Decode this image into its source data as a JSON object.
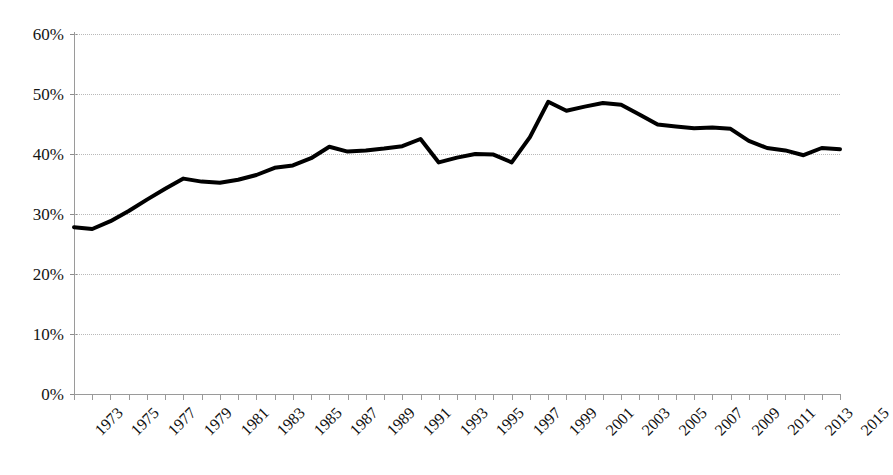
{
  "chart_data": {
    "type": "line",
    "title": "",
    "subtitle": "",
    "xlabel": "",
    "ylabel": "",
    "ylim": [
      0,
      60
    ],
    "xlim": [
      1973,
      2015
    ],
    "grid": true,
    "legend_position": "none",
    "y_tick_labels": [
      "60%",
      "50%",
      "40%",
      "30%",
      "20%",
      "10%",
      "0%"
    ],
    "y_tick_values": [
      60,
      50,
      40,
      30,
      20,
      10,
      0
    ],
    "x_tick_labels": [
      "1973",
      "1975",
      "1977",
      "1979",
      "1981",
      "1983",
      "1985",
      "1987",
      "1989",
      "1991",
      "1993",
      "1995",
      "1997",
      "1999",
      "2001",
      "2003",
      "2005",
      "2007",
      "2009",
      "2011",
      "2013",
      "2015"
    ],
    "x": [
      1973,
      1974,
      1975,
      1976,
      1977,
      1978,
      1979,
      1980,
      1981,
      1982,
      1983,
      1984,
      1985,
      1986,
      1987,
      1988,
      1989,
      1990,
      1991,
      1992,
      1993,
      1994,
      1995,
      1996,
      1997,
      1998,
      1999,
      2000,
      2001,
      2002,
      2003,
      2004,
      2005,
      2006,
      2007,
      2008,
      2009,
      2010,
      2011,
      2012,
      2013,
      2014,
      2015
    ],
    "series": [
      {
        "name": "Share",
        "color": "#000000",
        "values": [
          27.8,
          27.5,
          28.8,
          30.5,
          32.4,
          34.2,
          35.9,
          35.4,
          35.2,
          35.7,
          36.5,
          37.7,
          38.1,
          39.3,
          41.2,
          40.4,
          40.6,
          40.9,
          41.3,
          42.5,
          38.6,
          39.4,
          40.0,
          39.9,
          38.6,
          42.8,
          48.7,
          47.2,
          47.9,
          48.5,
          48.2,
          46.6,
          44.9,
          44.6,
          44.3,
          44.4,
          44.2,
          42.2,
          41.0,
          40.6,
          39.8,
          41.0,
          40.8
        ]
      }
    ],
    "units": "percent",
    "line_width_px": 4
  },
  "axes": {
    "y_axis_name": "percent-axis",
    "x_axis_name": "year-axis"
  },
  "colors": {
    "line": "#000000",
    "gridline": "#b9b9b9",
    "axis": "#9a9a9a",
    "text": "#141414",
    "background": "#ffffff"
  }
}
